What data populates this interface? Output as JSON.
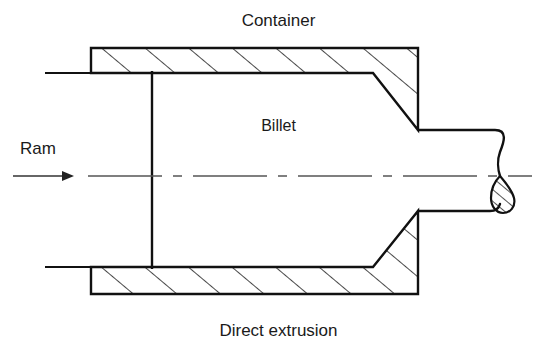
{
  "figure": {
    "title": "Direct extrusion",
    "domain": "engineering-diagram",
    "background_color": "#ffffff",
    "line_color": "#111111",
    "hatch_color": "#1a1a1a",
    "centerline_color": "#555555"
  },
  "labels": {
    "container": "Container",
    "billet": "Billet",
    "ram": "Ram",
    "caption": "Direct extrusion"
  },
  "geometry": {
    "canvas": {
      "width": 557,
      "height": 354
    },
    "container": {
      "top_wall": {
        "outer_y": 48,
        "inner_y": 73,
        "left_x": 91,
        "right_x": 418
      },
      "bottom_wall": {
        "inner_y": 267,
        "outer_y": 294,
        "left_x": 91,
        "right_x": 418
      },
      "die_taper_top": {
        "start_x": 373,
        "start_y": 73,
        "end_x": 418,
        "end_y": 130
      },
      "die_taper_bottom": {
        "start_x": 373,
        "start_y": 267,
        "end_x": 418,
        "end_y": 211
      }
    },
    "ram": {
      "face_x": 152,
      "face_top_y": 73,
      "face_bottom_y": 267,
      "stem_top_y": 70,
      "stem_bottom_y": 270,
      "arrow": {
        "x1": 13,
        "x2": 74,
        "y": 176
      }
    },
    "extrudate": {
      "top_y": 130,
      "bottom_y": 211,
      "left_x": 418,
      "break_x": 508,
      "tip_x": 520
    },
    "centerline": {
      "y": 176,
      "x1": 88,
      "x2": 532
    },
    "hatching": {
      "angle_deg": 50,
      "spacing_px": 28
    }
  },
  "icons": {
    "ram_arrow": "arrow-right-icon",
    "break_symbol": "broken-section-icon"
  }
}
